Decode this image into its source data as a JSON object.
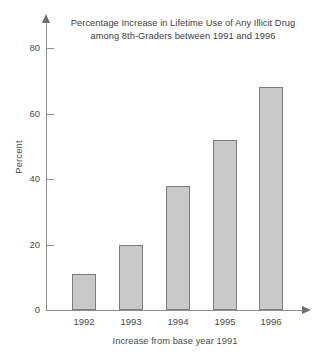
{
  "chart_data": {
    "type": "bar",
    "title": "Percentage Increase in Lifetime Use of Any Illicit Drug among 8th-Graders between 1991 and 1996",
    "title_lines": [
      "Percentage Increase in Lifetime Use of Any Illicit Drug",
      "among 8th-Graders between 1991 and 1996"
    ],
    "categories": [
      "1992",
      "1993",
      "1994",
      "1995",
      "1996"
    ],
    "values": [
      11,
      20,
      38,
      52,
      68
    ],
    "series": [
      {
        "name": "Percentage increase from 1991",
        "values": [
          11,
          20,
          38,
          52,
          68
        ]
      }
    ],
    "xlabel": "Increase from base year 1991",
    "ylabel": "Percent",
    "ylim": [
      0,
      88
    ],
    "yticks": [
      0,
      20,
      40,
      60,
      80
    ],
    "ytick_labels": [
      "0",
      "20",
      "40",
      "60",
      "80"
    ],
    "grid": false,
    "legend": false,
    "bar_fill_color": "#c9c9c9",
    "bar_border_color": "#7d7d7d",
    "axis_color": "#8f8f8f",
    "text_color": "#4a4a4a",
    "background_color": "#ffffff"
  }
}
